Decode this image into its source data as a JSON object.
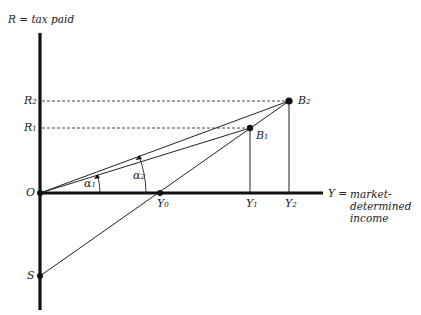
{
  "axes": {
    "y_label": "R = tax paid",
    "x_label_prefix": "Y =",
    "x_label_lines": [
      "market-",
      "determined",
      "income"
    ]
  },
  "points": {
    "origin": "O",
    "s": "S",
    "b1": {
      "base": "B",
      "sub": "1"
    },
    "b2": {
      "base": "B",
      "sub": "2"
    },
    "r1": {
      "base": "R",
      "sub": "1"
    },
    "r2": {
      "base": "R",
      "sub": "2"
    },
    "y0": {
      "base": "Y",
      "sub": "0"
    },
    "y1": {
      "base": "Y",
      "sub": "1"
    },
    "y2": {
      "base": "Y",
      "sub": "2"
    }
  },
  "angles": {
    "a1": {
      "base": "α",
      "sub": "1"
    },
    "a2": {
      "base": "α",
      "sub": "2"
    }
  },
  "colors": {
    "ink": "#111111",
    "dash": "#333333"
  }
}
